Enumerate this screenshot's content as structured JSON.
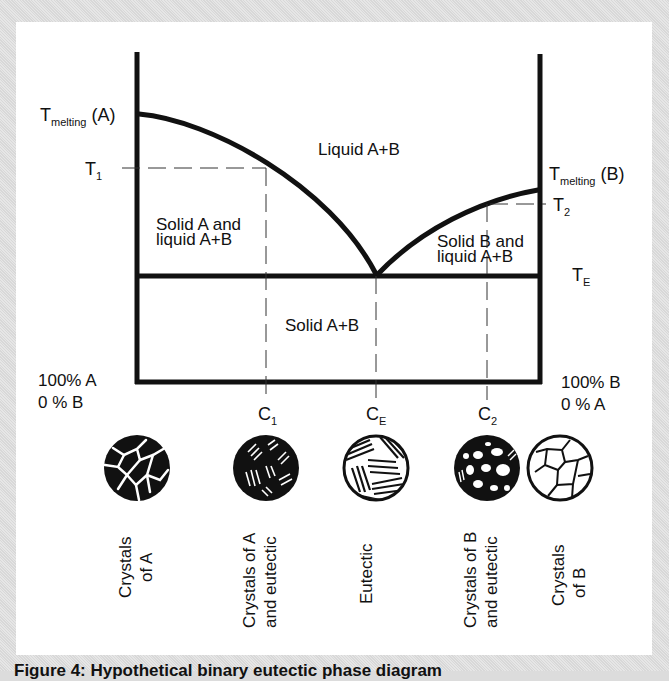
{
  "diagram": {
    "type": "binary eutectic phase diagram",
    "temperature_labels": {
      "t_melting_a_main": "T",
      "t_melting_a_sub": "melting",
      "t_melting_a_suffix": " (A)",
      "t_melting_b_main": "T",
      "t_melting_b_sub": "melting",
      "t_melting_b_suffix": " (B)",
      "t1_main": "T",
      "t1_sub": "1",
      "t2_main": "T",
      "t2_sub": "2",
      "te_main": "T",
      "te_sub": "E"
    },
    "regions": {
      "liquid": "Liquid A+B",
      "solid_a_liquid_line1": "Solid A and",
      "solid_a_liquid_line2": "liquid A+B",
      "solid_b_liquid_line1": "Solid B and",
      "solid_b_liquid_line2": "liquid A+B",
      "solid": "Solid A+B"
    },
    "composition_labels": {
      "left_line1": "100% A",
      "left_line2": "0 % B",
      "right_line1": "100% B",
      "right_line2": "0 % A",
      "c1_main": "C",
      "c1_sub": "1",
      "ce_main": "C",
      "ce_sub": "E",
      "c2_main": "C",
      "c2_sub": "2"
    },
    "microstructures": [
      {
        "id": "crystals-a",
        "line1": "Crystals",
        "line2": "of A"
      },
      {
        "id": "crystals-a-eutectic",
        "line1": "Crystals of A",
        "line2": "and eutectic"
      },
      {
        "id": "eutectic",
        "line1": "Eutectic",
        "line2": ""
      },
      {
        "id": "crystals-b-eutectic",
        "line1": "Crystals of B",
        "line2": "and eutectic"
      },
      {
        "id": "crystals-b",
        "line1": "Crystals",
        "line2": "of B"
      }
    ]
  },
  "caption": "Figure 4: Hypothetical binary eutectic phase diagram",
  "colors": {
    "line": "#111111",
    "background": "#ffffff",
    "frame": "#dedede"
  }
}
